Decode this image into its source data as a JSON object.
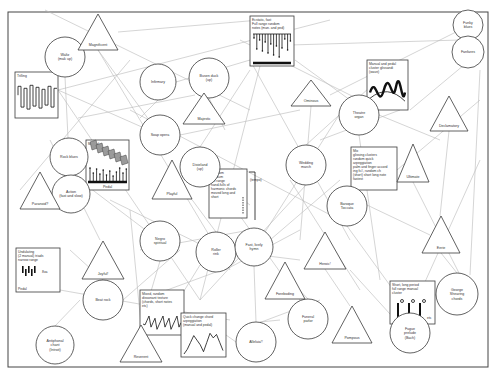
{
  "diagram": {
    "title": "",
    "frame": {
      "x": 8,
      "y": 12,
      "w": 480,
      "h": 355
    },
    "circles": [
      {
        "id": "waltz",
        "label": [
          "Waltz",
          "(mak up)"
        ],
        "cx": 65,
        "cy": 57,
        "r": 20
      },
      {
        "id": "rock-blues",
        "label": [
          "Rock blues"
        ],
        "cx": 69,
        "cy": 157,
        "r": 19
      },
      {
        "id": "action",
        "label": [
          "Action",
          "(fast and slow)"
        ],
        "cx": 71,
        "cy": 194,
        "r": 19
      },
      {
        "id": "infirmary",
        "label": [
          "Infirmary"
        ],
        "cx": 158,
        "cy": 82,
        "r": 18
      },
      {
        "id": "busen-duck",
        "label": [
          "Busen duck",
          "(up)"
        ],
        "cx": 209,
        "cy": 78,
        "r": 20
      },
      {
        "id": "soap-opera",
        "label": [
          "Soap opera"
        ],
        "cx": 160,
        "cy": 135,
        "r": 20
      },
      {
        "id": "dixieland",
        "label": [
          "Dixieland",
          "(up)"
        ],
        "cx": 200,
        "cy": 167,
        "r": 20
      },
      {
        "id": "negro-spiritual",
        "label": [
          "Negro",
          "spiritual"
        ],
        "cx": 160,
        "cy": 241,
        "r": 20
      },
      {
        "id": "roller-rink",
        "label": [
          "Roller",
          "rink"
        ],
        "cx": 216,
        "cy": 252,
        "r": 20
      },
      {
        "id": "fast-lively-hymn",
        "label": [
          "Fast, lively",
          "hymn"
        ],
        "cx": 254,
        "cy": 247,
        "r": 19
      },
      {
        "id": "wedding-march",
        "label": [
          "Wedding",
          "march"
        ],
        "cx": 306,
        "cy": 165,
        "r": 20
      },
      {
        "id": "theatre-organ",
        "label": [
          "Theatre",
          "organ"
        ],
        "cx": 359,
        "cy": 115,
        "r": 20
      },
      {
        "id": "baroque-toccata",
        "label": [
          "Baroque",
          "Toccata"
        ],
        "cx": 347,
        "cy": 206,
        "r": 20
      },
      {
        "id": "funky-blues",
        "label": [
          "Funky",
          "blues"
        ],
        "cx": 468,
        "cy": 25,
        "r": 15
      },
      {
        "id": "fanfares",
        "label": [
          "Fanfares"
        ],
        "cx": 468,
        "cy": 52,
        "r": 16
      },
      {
        "id": "beat-rock",
        "label": [
          "Beat rock"
        ],
        "cx": 103,
        "cy": 300,
        "r": 20
      },
      {
        "id": "antiphonal-chant",
        "label": [
          "Antiphonal",
          "chant",
          "(Introit)"
        ],
        "cx": 55,
        "cy": 345,
        "r": 19
      },
      {
        "id": "funeral-parlor",
        "label": [
          "Funeral",
          "parlor"
        ],
        "cx": 308,
        "cy": 319,
        "r": 20
      },
      {
        "id": "alleluia",
        "label": [
          "Alleluia!!"
        ],
        "cx": 256,
        "cy": 342,
        "r": 20
      },
      {
        "id": "george-shearing-chords",
        "label": [
          "George",
          "Shearing",
          "chords"
        ],
        "cx": 457,
        "cy": 294,
        "r": 21
      },
      {
        "id": "fugue-prelude",
        "label": [
          "Fugue",
          "prelude",
          "(Bach)"
        ],
        "cx": 410,
        "cy": 333,
        "r": 20
      }
    ],
    "triangles": [
      {
        "id": "magnificent",
        "label": "Magnificent",
        "cx": 98,
        "top": 14,
        "base": 50,
        "w": 40
      },
      {
        "id": "majestic",
        "label": "Majestic",
        "cx": 204,
        "top": 93,
        "base": 124,
        "w": 42
      },
      {
        "id": "playful",
        "label": "Playful",
        "cx": 172,
        "top": 160,
        "base": 199,
        "w": 40
      },
      {
        "id": "paranoid",
        "label": "Paranoid?",
        "cx": 40,
        "top": 172,
        "base": 209,
        "w": 40
      },
      {
        "id": "ominous",
        "label": "Ominous",
        "cx": 311,
        "top": 80,
        "base": 106,
        "w": 40
      },
      {
        "id": "declamatory",
        "label": "Declamatory",
        "cx": 449,
        "top": 96,
        "base": 131,
        "w": 38
      },
      {
        "id": "ultimate",
        "label": "Ultimate",
        "cx": 413,
        "top": 144,
        "base": 182,
        "w": 32
      },
      {
        "id": "eerie",
        "label": "Eerie",
        "cx": 441,
        "top": 216,
        "base": 253,
        "w": 38
      },
      {
        "id": "joyful",
        "label": "Joyful!",
        "cx": 103,
        "top": 241,
        "base": 279,
        "w": 42
      },
      {
        "id": "heroic",
        "label": "Heroic!",
        "cx": 325,
        "top": 232,
        "base": 269,
        "w": 42
      },
      {
        "id": "foreboding",
        "label": "Foreboding",
        "cx": 285,
        "top": 262,
        "base": 299,
        "w": 40
      },
      {
        "id": "pompous",
        "label": "Pompous",
        "cx": 352,
        "top": 306,
        "base": 343,
        "w": 40
      },
      {
        "id": "reverent",
        "label": "Reverent",
        "cx": 141,
        "top": 325,
        "base": 362,
        "w": 42
      }
    ],
    "boxes": [
      {
        "id": "trilling",
        "label": [
          "Trilling"
        ],
        "x": 15,
        "y": 72,
        "w": 43,
        "h": 46,
        "art": "trill"
      },
      {
        "id": "manual-pedal-arpeggio",
        "label": [
          "Manual"
        ],
        "label2": "Pedal",
        "x": 86,
        "y": 140,
        "w": 43,
        "h": 50,
        "art": "manualpedal"
      },
      {
        "id": "ecstatic-fast",
        "label": [
          "Ecstatic, fast",
          "Full range random",
          "notes (man. and ped)"
        ],
        "x": 250,
        "y": 16,
        "w": 44,
        "h": 50,
        "art": "ecstatic"
      },
      {
        "id": "manual-pedal-cluster",
        "label": [
          "Manual and pedal",
          "cluster glissandi",
          "(wave)"
        ],
        "x": 367,
        "y": 60,
        "w": 41,
        "h": 50,
        "art": "wave"
      },
      {
        "id": "random-medium",
        "label": [
          "Random",
          "medium",
          "full range",
          "hand-fulls of",
          "harmonic chords",
          "moved long and",
          "short"
        ],
        "x": 209,
        "y": 169,
        "w": 38,
        "h": 49,
        "art": "tempo",
        "side_label": "(tempo)"
      },
      {
        "id": "mix-glissing-clusters",
        "label": [
          "Mix",
          "glissing clusters",
          "random quick",
          "arpeggiation",
          "palm and finger accord",
          "ing fc#, random ch",
          "(short) short long note",
          "fastest"
        ],
        "x": 351,
        "y": 147,
        "w": 46,
        "h": 43,
        "art": "none"
      },
      {
        "id": "undulating",
        "label": [
          "Undulating",
          "(2 manual) triads",
          "narrow range"
        ],
        "x": 16,
        "y": 248,
        "w": 44,
        "h": 44,
        "art": "undulate",
        "sub": "Pedal",
        "side": "8va"
      },
      {
        "id": "mixed-random-dissonant",
        "label": [
          "Mixed, random",
          "dissonant texture",
          "(chords, short notes",
          "etc)"
        ],
        "x": 140,
        "y": 290,
        "w": 44,
        "h": 45,
        "art": "scribble"
      },
      {
        "id": "quick-change-chord",
        "label": [
          "Quick change chord",
          "arpeggiation",
          "(manual and pedal)"
        ],
        "x": 181,
        "y": 313,
        "w": 45,
        "h": 44,
        "art": "peaks"
      },
      {
        "id": "short-long-period",
        "label": [
          "Short, long period",
          "full range manual",
          "cluster"
        ],
        "x": 390,
        "y": 281,
        "w": 45,
        "h": 43,
        "art": "cluster",
        "side": "etc"
      }
    ],
    "links": [
      [
        58,
        90,
        200,
        300
      ],
      [
        58,
        90,
        330,
        20
      ],
      [
        58,
        90,
        160,
        135
      ],
      [
        45,
        10,
        250,
        110
      ],
      [
        65,
        77,
        68,
        138
      ],
      [
        98,
        50,
        160,
        135
      ],
      [
        98,
        50,
        230,
        270
      ],
      [
        118,
        32,
        260,
        20
      ],
      [
        130,
        110,
        340,
        220
      ],
      [
        78,
        118,
        195,
        95
      ],
      [
        50,
        140,
        100,
        240
      ],
      [
        20,
        190,
        130,
        60
      ],
      [
        90,
        188,
        160,
        241
      ],
      [
        110,
        200,
        216,
        252
      ],
      [
        140,
        250,
        250,
        230
      ],
      [
        158,
        100,
        140,
        118
      ],
      [
        176,
        82,
        250,
        60
      ],
      [
        209,
        98,
        225,
        130
      ],
      [
        180,
        135,
        300,
        110
      ],
      [
        190,
        160,
        250,
        205
      ],
      [
        218,
        185,
        300,
        300
      ],
      [
        200,
        147,
        250,
        70
      ],
      [
        240,
        40,
        360,
        100
      ],
      [
        290,
        45,
        460,
        40
      ],
      [
        295,
        60,
        350,
        100
      ],
      [
        260,
        66,
        200,
        300
      ],
      [
        311,
        106,
        300,
        240
      ],
      [
        330,
        95,
        460,
        30
      ],
      [
        320,
        140,
        400,
        110
      ],
      [
        290,
        180,
        360,
        290
      ],
      [
        306,
        185,
        200,
        300
      ],
      [
        306,
        145,
        400,
        60
      ],
      [
        339,
        115,
        260,
        240
      ],
      [
        359,
        135,
        380,
        280
      ],
      [
        379,
        115,
        440,
        140
      ],
      [
        410,
        110,
        470,
        60
      ],
      [
        449,
        131,
        440,
        216
      ],
      [
        413,
        182,
        460,
        275
      ],
      [
        397,
        170,
        480,
        100
      ],
      [
        480,
        70,
        470,
        275
      ],
      [
        367,
        205,
        430,
        235
      ],
      [
        347,
        226,
        410,
        313
      ],
      [
        320,
        300,
        240,
        330
      ],
      [
        325,
        269,
        350,
        306
      ],
      [
        308,
        299,
        290,
        280
      ],
      [
        254,
        266,
        256,
        322
      ],
      [
        216,
        272,
        140,
        300
      ],
      [
        216,
        232,
        170,
        170
      ],
      [
        236,
        252,
        300,
        260
      ],
      [
        60,
        290,
        230,
        320
      ],
      [
        55,
        326,
        80,
        300
      ],
      [
        123,
        300,
        180,
        250
      ],
      [
        103,
        280,
        70,
        250
      ],
      [
        141,
        325,
        130,
        210
      ],
      [
        160,
        261,
        141,
        325
      ],
      [
        200,
        265,
        160,
        330
      ],
      [
        225,
        270,
        300,
        230
      ],
      [
        270,
        240,
        340,
        180
      ],
      [
        250,
        60,
        350,
        240
      ],
      [
        436,
        294,
        425,
        316
      ],
      [
        457,
        273,
        441,
        253
      ],
      [
        400,
        325,
        350,
        270
      ],
      [
        420,
        293,
        480,
        160
      ],
      [
        226,
        335,
        236,
        342
      ],
      [
        280,
        320,
        260,
        322
      ]
    ],
    "stroke_color": "#3a3a3a",
    "link_color": "#b8b8b8",
    "background": "#ffffff"
  }
}
